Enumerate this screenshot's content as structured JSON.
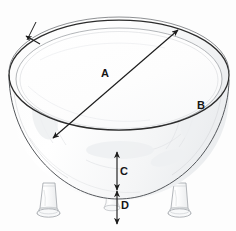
{
  "diagram": {
    "background_color": "#fdfdfd",
    "line_color": "#2b2b2b",
    "sketch_color": "#b9bcc0",
    "label_color": "#151515",
    "dimensions": [
      {
        "key": "A",
        "label": "A",
        "meaning": "diameter",
        "annotation": "double-headed diagonal arrow across top rim"
      },
      {
        "key": "B",
        "label": "B",
        "meaning": "circumference",
        "annotation": "arrow pointing to outer rim edge"
      },
      {
        "key": "C",
        "label": "C",
        "meaning": "bowl depth",
        "annotation": "vertical double-headed arrow on body"
      },
      {
        "key": "D",
        "label": "D",
        "meaning": "leg / base height",
        "annotation": "vertical double-headed arrow below bowl"
      }
    ],
    "parts": {
      "rim": "outer-rim-ellipse",
      "lip": "inner-lip-ellipse",
      "body": "bowl-body",
      "legs": [
        "leg-left",
        "leg-center",
        "leg-right"
      ]
    }
  }
}
